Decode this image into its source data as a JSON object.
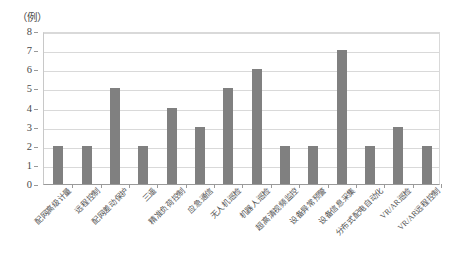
{
  "chart_data": {
    "type": "bar",
    "title": "",
    "subtitle": "",
    "xlabel": "",
    "ylabel": "（例）",
    "ylim": [
      0,
      8
    ],
    "ytick_labels": [
      "8",
      "7",
      "6",
      "5",
      "4",
      "3",
      "2",
      "1",
      "0"
    ],
    "ytick_values": [
      8,
      7,
      6,
      5,
      4,
      3,
      2,
      1,
      0
    ],
    "grid": true,
    "legend": null,
    "bar_color": "#808080",
    "categories": [
      "配网高级计量",
      "远程控制",
      "配网差动保护",
      "三遥",
      "精准负荷控制",
      "应急通信",
      "无人机巡检",
      "机器人巡检",
      "超高清视频监控",
      "设备异常预警",
      "设备信息采集",
      "分布式配电自动化",
      "VR/AR巡检",
      "VR/AR远程控制"
    ],
    "values": [
      2,
      2,
      5,
      2,
      4,
      3,
      5,
      6,
      2,
      2,
      7,
      2,
      3,
      2
    ],
    "series": [
      {
        "name": "",
        "values": [
          2,
          2,
          5,
          2,
          4,
          3,
          5,
          6,
          2,
          2,
          7,
          2,
          3,
          2
        ]
      }
    ]
  }
}
